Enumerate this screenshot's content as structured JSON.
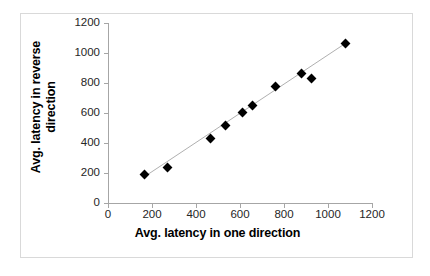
{
  "chart_data": {
    "type": "scatter",
    "title": "",
    "xlabel": "Avg. latency in one direction",
    "ylabel": "Avg. latency in reverse direction",
    "ylabel_lines": [
      "Avg. latency in reverse",
      "direction"
    ],
    "xlim": [
      0,
      1200
    ],
    "ylim": [
      0,
      1200
    ],
    "xticks": [
      0,
      200,
      400,
      600,
      800,
      1000,
      1200
    ],
    "yticks": [
      0,
      200,
      400,
      600,
      800,
      1000,
      1200
    ],
    "grid": false,
    "legend": false,
    "marker": "diamond",
    "marker_color": "#000000",
    "trendline": {
      "visible": true,
      "color": "#a6a6a6",
      "x": [
        165,
        1080
      ],
      "y": [
        175,
        1065
      ]
    },
    "points": [
      {
        "x": 165,
        "y": 188
      },
      {
        "x": 272,
        "y": 240
      },
      {
        "x": 468,
        "y": 432
      },
      {
        "x": 535,
        "y": 518
      },
      {
        "x": 610,
        "y": 605
      },
      {
        "x": 657,
        "y": 652
      },
      {
        "x": 760,
        "y": 775
      },
      {
        "x": 880,
        "y": 865
      },
      {
        "x": 925,
        "y": 830
      },
      {
        "x": 1080,
        "y": 1065
      }
    ]
  },
  "axis": {
    "xtick_labels": [
      "0",
      "200",
      "400",
      "600",
      "800",
      "1000",
      "1200"
    ],
    "ytick_labels": [
      "0",
      "200",
      "400",
      "600",
      "800",
      "1000",
      "1200"
    ]
  }
}
